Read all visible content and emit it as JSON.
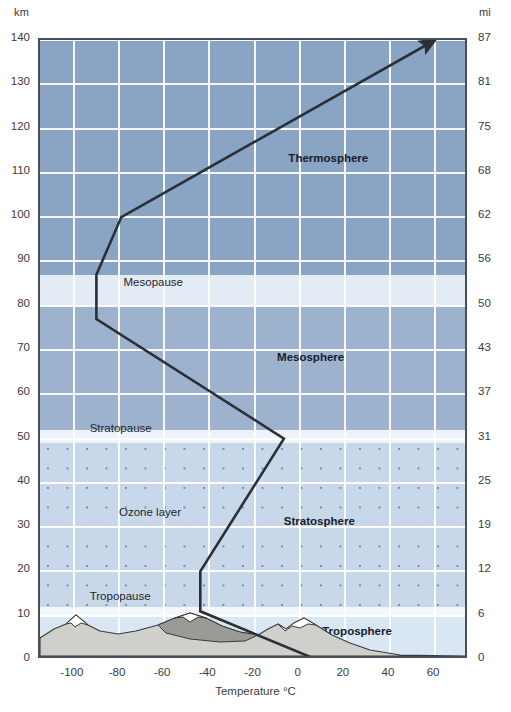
{
  "chart_data": {
    "type": "line",
    "title": "",
    "xlabel": "Temperature °C",
    "ylabel": "km",
    "y2label": "mi",
    "xlim": [
      -115,
      75
    ],
    "ylim": [
      0,
      140
    ],
    "y2lim": [
      0,
      87
    ],
    "grid": true,
    "legend": "none",
    "xticks": [
      "-100",
      "-80",
      "-60",
      "-40",
      "-20",
      "0",
      "20",
      "40",
      "60"
    ],
    "xtick_values": [
      -100,
      -80,
      -60,
      -40,
      -20,
      0,
      20,
      40,
      60
    ],
    "yticks_km": [
      "0",
      "10",
      "20",
      "30",
      "40",
      "50",
      "60",
      "70",
      "80",
      "90",
      "100",
      "110",
      "120",
      "130",
      "140"
    ],
    "ytick_values_km": [
      0,
      10,
      20,
      30,
      40,
      50,
      60,
      70,
      80,
      90,
      100,
      110,
      120,
      130,
      140
    ],
    "yticks_mi": [
      "0",
      "6",
      "12",
      "19",
      "25",
      "31",
      "37",
      "43",
      "50",
      "56",
      "62",
      "68",
      "75",
      "81",
      "87"
    ],
    "ytick_values_mi": [
      0,
      6,
      12,
      19,
      25,
      31,
      37,
      43,
      50,
      56,
      62,
      68,
      75,
      81,
      87
    ],
    "series": [
      {
        "name": "Temperature profile",
        "color": "#2b2f36",
        "arrow_head": true,
        "points": [
          {
            "t": 8,
            "km": 0
          },
          {
            "t": -44,
            "km": 11
          },
          {
            "t": -44,
            "km": 20
          },
          {
            "t": -7,
            "km": 50
          },
          {
            "t": -90,
            "km": 77
          },
          {
            "t": -90,
            "km": 87
          },
          {
            "t": -79,
            "km": 100
          },
          {
            "t": 60,
            "km": 140
          }
        ]
      }
    ],
    "annotations": [
      {
        "text": "Thermosphere",
        "t": -5,
        "km": 113,
        "bold": true
      },
      {
        "text": "Mesopause",
        "t": -78,
        "km": 85,
        "bold": false
      },
      {
        "text": "Mesosphere",
        "t": -10,
        "km": 68,
        "bold": true
      },
      {
        "text": "Stratopause",
        "t": -93,
        "km": 52,
        "bold": false
      },
      {
        "text": "Ozone layer",
        "t": -80,
        "km": 33,
        "bold": false
      },
      {
        "text": "Stratosphere",
        "t": -7,
        "km": 31,
        "bold": true
      },
      {
        "text": "Tropopause",
        "t": -93,
        "km": 14,
        "bold": false
      },
      {
        "text": "Troposphere",
        "t": 10,
        "km": 6,
        "bold": true
      }
    ],
    "bands": [
      {
        "name": "thermosphere",
        "from_km": 87,
        "to_km": 140,
        "color": "#8aa4c4"
      },
      {
        "name": "mesopause",
        "from_km": 80,
        "to_km": 87,
        "color": "#e3ecf5"
      },
      {
        "name": "mesosphere",
        "from_km": 52,
        "to_km": 80,
        "color": "#9db3cd"
      },
      {
        "name": "stratopause",
        "from_km": 49,
        "to_km": 52,
        "color": "#eef4fa"
      },
      {
        "name": "stratosphere",
        "from_km": 12,
        "to_km": 49,
        "color": "#c8d8ea"
      },
      {
        "name": "tropopause",
        "from_km": 10,
        "to_km": 12,
        "color": "#f2f7fb"
      },
      {
        "name": "troposphere",
        "from_km": 0,
        "to_km": 10,
        "color": "#d8e7f3"
      }
    ],
    "ozone_layer": {
      "from_km": 12,
      "to_km": 49,
      "pattern": "dots"
    },
    "surface_feature": "mountain-range-silhouette"
  },
  "axes": {
    "left_unit": "km",
    "right_unit": "mi",
    "x_title": "Temperature °C"
  },
  "colors": {
    "frame": "#4a4f57",
    "curve": "#2b2f36",
    "gridline": "#ffffff",
    "text": "#3b3b3b",
    "mountain_fill": "#cfcfcb",
    "mountain_shadow": "#9a9a96",
    "snow": "#ffffff"
  }
}
